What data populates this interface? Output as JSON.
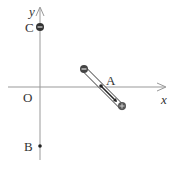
{
  "diagram": {
    "axes": {
      "x_label": "x",
      "y_label": "y",
      "origin_label": "O"
    },
    "points": {
      "A": {
        "label": "A"
      },
      "B": {
        "label": "B"
      },
      "C": {
        "label": "C"
      }
    },
    "charges": {
      "C": "negative",
      "rod_top": "negative",
      "rod_bottom": "positive"
    },
    "colors": {
      "axis": "#888888",
      "charge": "#333333",
      "text": "#333333"
    }
  }
}
